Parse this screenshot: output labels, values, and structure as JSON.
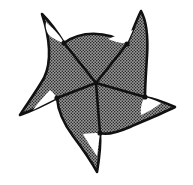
{
  "figure": {
    "caption": "",
    "type": "line-drawing",
    "canvas": {
      "width": 193,
      "height": 185,
      "background": "#ffffff"
    },
    "colors": {
      "outline": "#111111",
      "body_fill_gray": "#8a8a8a",
      "halftone_dot": "#2e2e2e",
      "highlight_white": "#ffffff",
      "radial_line": "#111111"
    },
    "symmetry": {
      "order": 5,
      "kind": "pentaradial"
    },
    "center_point": {
      "x": 96,
      "y": 83,
      "label": "center"
    },
    "spikes": [
      {
        "name": "spike-upper-left",
        "tip": {
          "x": 42,
          "y": 14
        },
        "vertex": {
          "x": 64,
          "y": 43
        },
        "has_white_highlight": true
      },
      {
        "name": "spike-upper-right",
        "tip": {
          "x": 141,
          "y": 11
        },
        "vertex": {
          "x": 127,
          "y": 44
        },
        "has_white_highlight": true
      },
      {
        "name": "spike-right",
        "tip": {
          "x": 175,
          "y": 107
        },
        "vertex": {
          "x": 145,
          "y": 97
        },
        "has_white_highlight": true
      },
      {
        "name": "spike-bottom",
        "tip": {
          "x": 97,
          "y": 172
        },
        "vertex": {
          "x": 100,
          "y": 133
        },
        "has_white_highlight": true
      },
      {
        "name": "spike-left",
        "tip": {
          "x": 20,
          "y": 115
        },
        "vertex": {
          "x": 57,
          "y": 98
        },
        "has_white_highlight": true
      }
    ],
    "radial_lines": [
      {
        "name": "radial-line-upper-left",
        "from": {
          "x": 96,
          "y": 83
        },
        "to": {
          "x": 64,
          "y": 43
        }
      },
      {
        "name": "radial-line-upper-right",
        "from": {
          "x": 96,
          "y": 83
        },
        "to": {
          "x": 127,
          "y": 44
        }
      },
      {
        "name": "radial-line-right",
        "from": {
          "x": 96,
          "y": 83
        },
        "to": {
          "x": 145,
          "y": 97
        }
      },
      {
        "name": "radial-line-bottom",
        "from": {
          "x": 96,
          "y": 83
        },
        "to": {
          "x": 100,
          "y": 133
        }
      },
      {
        "name": "radial-line-left",
        "from": {
          "x": 96,
          "y": 83
        },
        "to": {
          "x": 57,
          "y": 98
        }
      }
    ],
    "body_outline_path": "M 42 14 C 52 24, 58 33, 64 43 C 80 31, 106 30, 127 44 C 132 33, 136 21, 141 11 C 147 22, 148 40, 147 56 C 146 72, 145 86, 145 97 C 156 99, 166 103, 175 107 C 163 113, 146 120, 130 127 C 116 133, 106 135, 100 133 C 101 146, 99 160, 97 172 C 91 161, 82 148, 73 136 C 64 124, 58 111, 57 98 C 44 105, 31 111, 20 115 C 27 104, 36 92, 44 78 C 52 62, 50 38, 42 14 Z",
    "highlight_paths": [
      {
        "name": "highlight-upper-left",
        "d": "M 46 22 C 55 30, 61 37, 64 43 C 60 42, 53 39, 48 34 C 46 30, 45 26, 46 22 Z"
      },
      {
        "name": "highlight-upper-right",
        "d": "M 133 30 C 130 37, 128 41, 127 44 C 120 43, 113 41, 108 39 C 117 35, 126 32, 133 30 Z"
      },
      {
        "name": "highlight-right",
        "d": "M 145 97 C 152 99, 157 101, 161 103 C 155 108, 148 112, 141 115 C 140 108, 142 101, 145 97 Z"
      },
      {
        "name": "highlight-bottom",
        "d": "M 100 133 C 99 141, 98 149, 97 156 C 92 149, 87 141, 83 134 C 89 133, 95 133, 100 133 Z"
      },
      {
        "name": "highlight-left",
        "d": "M 57 98 C 49 102, 41 106, 33 110 C 38 103, 44 96, 50 90 C 53 92, 55 95, 57 98 Z"
      }
    ]
  }
}
